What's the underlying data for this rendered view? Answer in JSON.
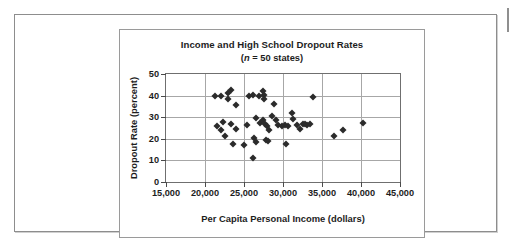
{
  "figure": {
    "title": "Income and High School Dropout Rates",
    "subtitle_prefix": "(",
    "subtitle_italic": "n",
    "subtitle_suffix": " = 50 states)"
  },
  "chart_data": {
    "type": "scatter",
    "title": "Income and High School Dropout Rates",
    "subtitle": "(n = 50 states)",
    "xlabel": "Per Capita Personal Income (dollars)",
    "ylabel": "Dropout Rate (percent)",
    "xlim": [
      15000,
      45000
    ],
    "ylim": [
      0,
      50
    ],
    "xticks": [
      15000,
      20000,
      25000,
      30000,
      35000,
      40000,
      45000
    ],
    "xticklabels": [
      "15,000",
      "20,000",
      "25,000",
      "30,000",
      "35,000",
      "40,000",
      "45,000"
    ],
    "yticks": [
      0,
      10,
      20,
      30,
      40,
      50
    ],
    "yticklabels": [
      "0",
      "10",
      "20",
      "30",
      "40",
      "50"
    ],
    "grid": true,
    "legend": null,
    "marker": "diamond",
    "marker_color": "#2b2b2b",
    "series": [
      {
        "name": "States",
        "points": [
          [
            21300,
            40.0
          ],
          [
            22100,
            40.0
          ],
          [
            22900,
            41.0
          ],
          [
            23300,
            42.5
          ],
          [
            23000,
            38.5
          ],
          [
            24000,
            35.5
          ],
          [
            25600,
            40.0
          ],
          [
            26200,
            40.5
          ],
          [
            26900,
            40.0
          ],
          [
            27400,
            42.0
          ],
          [
            27500,
            40.5
          ],
          [
            27600,
            38.5
          ],
          [
            28800,
            36.0
          ],
          [
            33900,
            39.5
          ],
          [
            22300,
            28.0
          ],
          [
            21600,
            26.0
          ],
          [
            22100,
            24.0
          ],
          [
            23300,
            27.0
          ],
          [
            22600,
            21.5
          ],
          [
            24000,
            24.5
          ],
          [
            25400,
            26.5
          ],
          [
            26500,
            29.5
          ],
          [
            27000,
            27.5
          ],
          [
            27400,
            28.5
          ],
          [
            27700,
            27.0
          ],
          [
            28000,
            26.0
          ],
          [
            28200,
            24.0
          ],
          [
            28600,
            30.5
          ],
          [
            29100,
            28.5
          ],
          [
            29400,
            26.5
          ],
          [
            29900,
            26.0
          ],
          [
            30300,
            26.5
          ],
          [
            30700,
            26.0
          ],
          [
            31100,
            32.0
          ],
          [
            31300,
            29.0
          ],
          [
            31800,
            26.5
          ],
          [
            32200,
            24.5
          ],
          [
            32500,
            27.0
          ],
          [
            32800,
            27.0
          ],
          [
            33100,
            26.5
          ],
          [
            33400,
            27.0
          ],
          [
            23600,
            17.5
          ],
          [
            25000,
            17.0
          ],
          [
            26300,
            20.5
          ],
          [
            26600,
            18.5
          ],
          [
            27800,
            19.5
          ],
          [
            28100,
            19.0
          ],
          [
            30400,
            17.5
          ],
          [
            26100,
            11.0
          ],
          [
            36600,
            21.5
          ],
          [
            37700,
            24.0
          ],
          [
            40300,
            27.5
          ]
        ]
      }
    ]
  }
}
